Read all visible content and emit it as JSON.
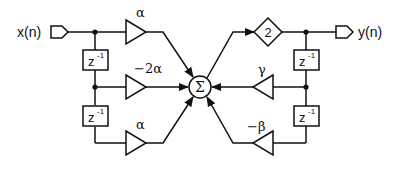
{
  "diagram": {
    "type": "signal-flow-block-diagram",
    "input": {
      "label": "x(n)"
    },
    "output": {
      "label": "y(n)"
    },
    "summer": {
      "symbol": "Σ"
    },
    "output_scaler": {
      "label": "2"
    },
    "delays": [
      {
        "id": "fwd-delay-1",
        "label": "z",
        "exponent": "-1"
      },
      {
        "id": "fwd-delay-2",
        "label": "z",
        "exponent": "-1"
      },
      {
        "id": "fb-delay-1",
        "label": "z",
        "exponent": "-1"
      },
      {
        "id": "fb-delay-2",
        "label": "z",
        "exponent": "-1"
      }
    ],
    "feedforward_gains": [
      {
        "label": "α"
      },
      {
        "label": "−2α"
      },
      {
        "label": "α"
      }
    ],
    "feedback_gains": [
      {
        "label": "γ"
      },
      {
        "label": "−β"
      }
    ],
    "colors": {
      "stroke": "#111111",
      "background": "#ffffff"
    }
  }
}
